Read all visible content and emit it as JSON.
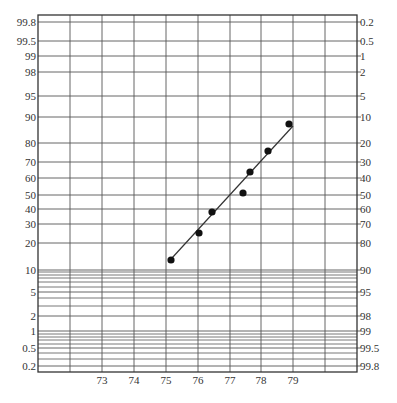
{
  "chart_data": {
    "type": "scatter",
    "title": "",
    "subtitle": "",
    "xlabel": "",
    "ylabel": "",
    "ylabel_right": "",
    "scale": "normal probability",
    "grid": true,
    "legend": null,
    "x_ticks": [
      73,
      74,
      75,
      76,
      77,
      78,
      79
    ],
    "xlim": [
      71,
      81
    ],
    "left_y_ticks": [
      "99.8",
      "99.5",
      "99",
      "98",
      "95",
      "90",
      "80",
      "70",
      "60",
      "50",
      "40",
      "30",
      "20",
      "10",
      "5",
      "2",
      "1",
      "0.5",
      "0.2"
    ],
    "right_y_ticks": [
      "0.2",
      "0.5",
      "1",
      "2",
      "5",
      "10",
      "20",
      "30",
      "40",
      "50",
      "60",
      "70",
      "80",
      "90",
      "95",
      "98",
      "99",
      "99.5",
      "99.8"
    ],
    "ylim_percent": [
      0.2,
      99.8
    ],
    "points": [
      {
        "x": 75.2,
        "y": 13
      },
      {
        "x": 76.1,
        "y": 25
      },
      {
        "x": 76.5,
        "y": 38
      },
      {
        "x": 77.5,
        "y": 51
      },
      {
        "x": 77.7,
        "y": 64
      },
      {
        "x": 78.3,
        "y": 76
      },
      {
        "x": 78.9,
        "y": 88
      }
    ],
    "fit_line": {
      "x_start": 75.25,
      "y_start": 13.5,
      "x_end": 79.0,
      "y_end": 87
    }
  },
  "layout": {
    "plot_left": 38,
    "plot_right": 357,
    "plot_top": 15,
    "plot_bottom": 372,
    "x_px_per_unit": 31.9,
    "x_origin_value": 72,
    "x_origin_px": 70,
    "extra_vertical_lines_px": [
      70,
      325
    ],
    "labeled_lines": [
      {
        "left": "99.8",
        "right": "0.2",
        "y": 22
      },
      {
        "left": "99.5",
        "right": "0.5",
        "y": 41
      },
      {
        "left": "99",
        "right": "1",
        "y": 56
      },
      {
        "left": "98",
        "right": "2",
        "y": 72
      },
      {
        "left": "95",
        "right": "5",
        "y": 96
      },
      {
        "left": "90",
        "right": "10",
        "y": 117
      },
      {
        "left": "80",
        "right": "20",
        "y": 143
      },
      {
        "left": "70",
        "right": "30",
        "y": 162
      },
      {
        "left": "60",
        "right": "40",
        "y": 178
      },
      {
        "left": "50",
        "right": "50",
        "y": 195
      },
      {
        "left": "40",
        "right": "60",
        "y": 209
      },
      {
        "left": "30",
        "right": "70",
        "y": 224
      },
      {
        "left": "20",
        "right": "80",
        "y": 243
      },
      {
        "left": "10",
        "right": "90",
        "y": 270
      },
      {
        "left": "5",
        "right": "95",
        "y": 292
      },
      {
        "left": "2",
        "right": "98",
        "y": 316
      },
      {
        "left": "1",
        "right": "99",
        "y": 331
      },
      {
        "left": "0.5",
        "right": "99.5",
        "y": 348
      },
      {
        "left": "0.2",
        "right": "99.8",
        "y": 366
      }
    ],
    "minor_lines_y": [
      272,
      275,
      278,
      282,
      287,
      298,
      306,
      334,
      337,
      340,
      344,
      353,
      359
    ],
    "point_px": [
      [
        171,
        260
      ],
      [
        199,
        233
      ],
      [
        212,
        212
      ],
      [
        243,
        193
      ],
      [
        250,
        172
      ],
      [
        268,
        151
      ],
      [
        289,
        124
      ]
    ],
    "line_px": [
      172,
      258,
      293,
      126
    ],
    "x_label_y": 384
  },
  "colors": {
    "grid": "#555555",
    "frame": "#333333",
    "points": "#111111",
    "fit_line": "#333333",
    "text": "#333333"
  }
}
